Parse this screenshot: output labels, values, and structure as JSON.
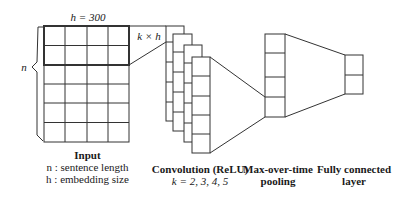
{
  "diagram": {
    "input": {
      "width_label": "h = 300",
      "height_label": "n",
      "filter_label": "k × h",
      "rows": 6,
      "cols": 4,
      "caption_title": "Input",
      "caption_lines": [
        "n : sentence length",
        "h : embedding size"
      ]
    },
    "convolution": {
      "feature_maps": 4,
      "caption_title": "Convolution (ReLU)",
      "caption_sub": "k = 2, 3, 4, 5"
    },
    "pooling": {
      "caption_lines": [
        "Max-over-time",
        "pooling"
      ]
    },
    "fully_connected": {
      "caption_lines": [
        "Fully connected",
        "layer"
      ]
    },
    "colors": {
      "stroke": "#333333",
      "background": "#ffffff"
    }
  }
}
